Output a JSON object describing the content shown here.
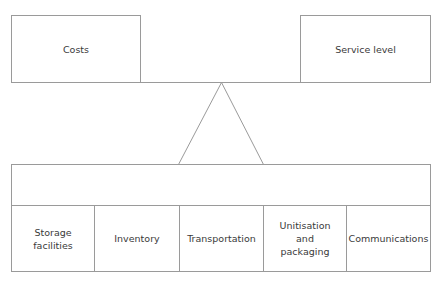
{
  "diagram": {
    "type": "trade-off balance diagram",
    "top_boxes": [
      {
        "id": "costs",
        "label": "Costs"
      },
      {
        "id": "service-level",
        "label": "Service level"
      }
    ],
    "fulcrum": "triangle",
    "bottom_cells": [
      {
        "id": "storage-facilities",
        "label": "Storage\nfacilities"
      },
      {
        "id": "inventory",
        "label": "Inventory"
      },
      {
        "id": "transportation",
        "label": "Transportation"
      },
      {
        "id": "unitisation-packaging",
        "label": "Unitisation\nand\npackaging"
      },
      {
        "id": "communications",
        "label": "Communications"
      }
    ],
    "colors": {
      "line": "#9a9a9a",
      "text": "#3a3a3a",
      "background": "#ffffff"
    }
  }
}
